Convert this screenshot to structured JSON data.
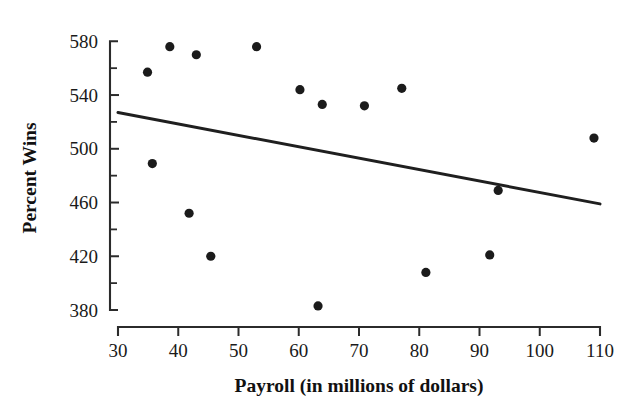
{
  "chart_data": {
    "type": "scatter",
    "title": "",
    "xlabel": "Payroll (in millions of dollars)",
    "ylabel": "Percent Wins",
    "xlim": [
      30,
      110
    ],
    "ylim": [
      380,
      580
    ],
    "xticks": [
      30,
      40,
      50,
      60,
      70,
      80,
      90,
      100,
      110
    ],
    "yticks": [
      580,
      540,
      500,
      460,
      420,
      380
    ],
    "xtick_labels": [
      "30",
      "40",
      "50",
      "60",
      "70",
      "80",
      "90",
      "100",
      "110"
    ],
    "ytick_labels": [
      "580",
      "540",
      "500",
      "460",
      "420",
      "380"
    ],
    "y_minor_ticks": [
      560,
      520,
      480,
      440,
      400
    ],
    "grid": false,
    "legend": null,
    "marker": "filled-circle",
    "marker_color": "#1b1b1b",
    "marker_size": 4.6,
    "points": [
      {
        "x": 34.9,
        "y": 557
      },
      {
        "x": 35.7,
        "y": 489
      },
      {
        "x": 38.6,
        "y": 576
      },
      {
        "x": 41.8,
        "y": 452
      },
      {
        "x": 43.0,
        "y": 570
      },
      {
        "x": 45.4,
        "y": 420
      },
      {
        "x": 53.0,
        "y": 576
      },
      {
        "x": 60.2,
        "y": 544
      },
      {
        "x": 63.2,
        "y": 383
      },
      {
        "x": 63.9,
        "y": 533
      },
      {
        "x": 70.9,
        "y": 532
      },
      {
        "x": 77.1,
        "y": 545
      },
      {
        "x": 81.1,
        "y": 408
      },
      {
        "x": 91.7,
        "y": 421
      },
      {
        "x": 93.1,
        "y": 469
      },
      {
        "x": 109.0,
        "y": 508
      }
    ],
    "trend_line": {
      "type": "linear-fit",
      "color": "#1f1f1f",
      "x_start": 30,
      "y_start": 527,
      "x_end": 110,
      "y_end": 459
    }
  }
}
